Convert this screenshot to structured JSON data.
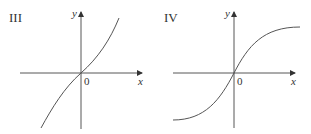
{
  "panels": [
    {
      "id": "III",
      "label": "III",
      "x_axis_label": "x",
      "y_axis_label": "y",
      "origin_label": "0",
      "curve_description": "increasing cubic-like curve through origin, steep at ends, flatter near origin",
      "curve_path": "M41,128 C52,108 64,88 81,73 C98,58 110,40 119,18"
    },
    {
      "id": "IV",
      "label": "IV",
      "x_axis_label": "x",
      "y_axis_label": "y",
      "origin_label": "0",
      "curve_description": "increasing S-shaped (sigmoid) curve through origin, leveling off toward horizontal asymptotes at both ends",
      "curve_path": "M173,120 C205,120 220,100 234,73 C248,46 263,27 300,27"
    }
  ],
  "colors": {
    "axis": "#444444",
    "curve": "#555555",
    "text": "#333333",
    "background": "#ffffff"
  }
}
